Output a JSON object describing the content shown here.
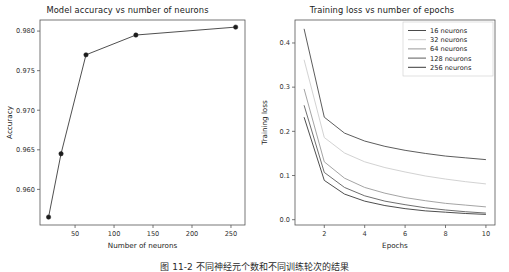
{
  "figure": {
    "caption": "图 11-2  不同神经元个数和不同训练轮次的结果",
    "caption_visible_note": "caption-cropped-at-image-bottom"
  },
  "chart_data": [
    {
      "id": "accuracy-vs-neurons",
      "type": "line",
      "title": "Model accuracy vs number of neurons",
      "xlabel": "Number of neurons",
      "ylabel": "Accuracy",
      "x": [
        16,
        32,
        64,
        128,
        256
      ],
      "values": [
        0.9565,
        0.9645,
        0.977,
        0.9795,
        0.9805
      ],
      "xlim": [
        5,
        268
      ],
      "ylim": [
        0.9555,
        0.9814
      ],
      "xticks": [
        50,
        100,
        150,
        200,
        250
      ],
      "xtick_labels": [
        "50",
        "100",
        "150",
        "200",
        "250"
      ],
      "yticks": [
        0.96,
        0.965,
        0.97,
        0.975,
        0.98
      ],
      "ytick_labels": [
        "0.960",
        "0.965",
        "0.970",
        "0.975",
        "0.980"
      ],
      "grid": false,
      "legend": "none",
      "marker": "circle",
      "line_color": "#3b3b3b",
      "marker_color": "#1c1c1c"
    },
    {
      "id": "loss-vs-epochs",
      "type": "line",
      "title": "Training loss vs number of epochs",
      "xlabel": "Epochs",
      "ylabel": "Training loss",
      "x": [
        1,
        2,
        3,
        4,
        5,
        6,
        7,
        8,
        9,
        10
      ],
      "xlim": [
        0.55,
        10.45
      ],
      "ylim": [
        -0.012,
        0.452
      ],
      "xticks": [
        2,
        4,
        6,
        8,
        10
      ],
      "xtick_labels": [
        "2",
        "4",
        "6",
        "8",
        "10"
      ],
      "yticks": [
        0.0,
        0.1,
        0.2,
        0.3,
        0.4
      ],
      "ytick_labels": [
        "0.0",
        "0.1",
        "0.2",
        "0.3",
        "0.4"
      ],
      "grid": false,
      "legend_position": "upper right",
      "series": [
        {
          "name": "16 neurons",
          "color": "#4a4a4a",
          "values": [
            0.432,
            0.232,
            0.196,
            0.178,
            0.166,
            0.157,
            0.15,
            0.144,
            0.14,
            0.136
          ]
        },
        {
          "name": "32 neurons",
          "color": "#cdcdcd",
          "values": [
            0.362,
            0.186,
            0.151,
            0.131,
            0.118,
            0.108,
            0.099,
            0.092,
            0.086,
            0.081
          ]
        },
        {
          "name": "64 neurons",
          "color": "#9a9a9a",
          "values": [
            0.296,
            0.131,
            0.094,
            0.073,
            0.06,
            0.05,
            0.043,
            0.037,
            0.033,
            0.029
          ]
        },
        {
          "name": "128 neurons",
          "color": "#5d5d5d",
          "values": [
            0.259,
            0.107,
            0.073,
            0.054,
            0.042,
            0.034,
            0.027,
            0.022,
            0.018,
            0.015
          ]
        },
        {
          "name": "256 neurons",
          "color": "#3a3a3a",
          "values": [
            0.232,
            0.089,
            0.058,
            0.042,
            0.032,
            0.025,
            0.02,
            0.017,
            0.014,
            0.012
          ]
        }
      ]
    }
  ]
}
